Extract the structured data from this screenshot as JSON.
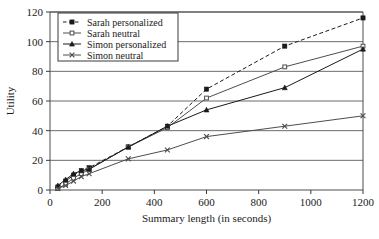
{
  "chart_data": {
    "type": "line",
    "title": "",
    "xlabel": "Summary length (in seconds)",
    "ylabel": "Utility",
    "xlim": [
      0,
      1200
    ],
    "ylim": [
      0,
      120
    ],
    "xticks": [
      0,
      200,
      400,
      600,
      800,
      1000,
      1200
    ],
    "yticks": [
      0,
      20,
      40,
      60,
      80,
      100,
      120
    ],
    "xtick_labels": [
      "0",
      "200",
      "400",
      "600",
      "800",
      "1000",
      "1200"
    ],
    "ytick_labels": [
      "0",
      "20",
      "40",
      "60",
      "80",
      "100",
      "120"
    ],
    "grid": "horizontal",
    "legend_position": "top-left",
    "x": [
      30,
      60,
      90,
      120,
      150,
      300,
      450,
      600,
      900,
      1200
    ],
    "series": [
      {
        "name": "Sarah personalized",
        "marker": "square",
        "linestyle": "dashed",
        "color": "#1a1a1a",
        "values": [
          2,
          6,
          10,
          13,
          15,
          29,
          43,
          68,
          97,
          116
        ]
      },
      {
        "name": "Sarah neutral",
        "marker": "square-small",
        "linestyle": "solid",
        "color": "#4d4d4d",
        "values": [
          1,
          4,
          8,
          11,
          14,
          29,
          42,
          62,
          83,
          97
        ]
      },
      {
        "name": "Simon personalized",
        "marker": "triangle",
        "linestyle": "solid",
        "color": "#1a1a1a",
        "values": [
          3,
          7,
          11,
          13,
          14,
          29,
          43,
          54,
          69,
          95
        ]
      },
      {
        "name": "Simon neutral",
        "marker": "x",
        "linestyle": "solid",
        "color": "#4d4d4d",
        "values": [
          1,
          3,
          6,
          9,
          11,
          21,
          27,
          36,
          43,
          50
        ]
      }
    ]
  },
  "legend": {
    "entries": [
      {
        "label": "Sarah personalized"
      },
      {
        "label": "Sarah neutral"
      },
      {
        "label": "Simon personalized"
      },
      {
        "label": "Simon neutral"
      }
    ]
  }
}
